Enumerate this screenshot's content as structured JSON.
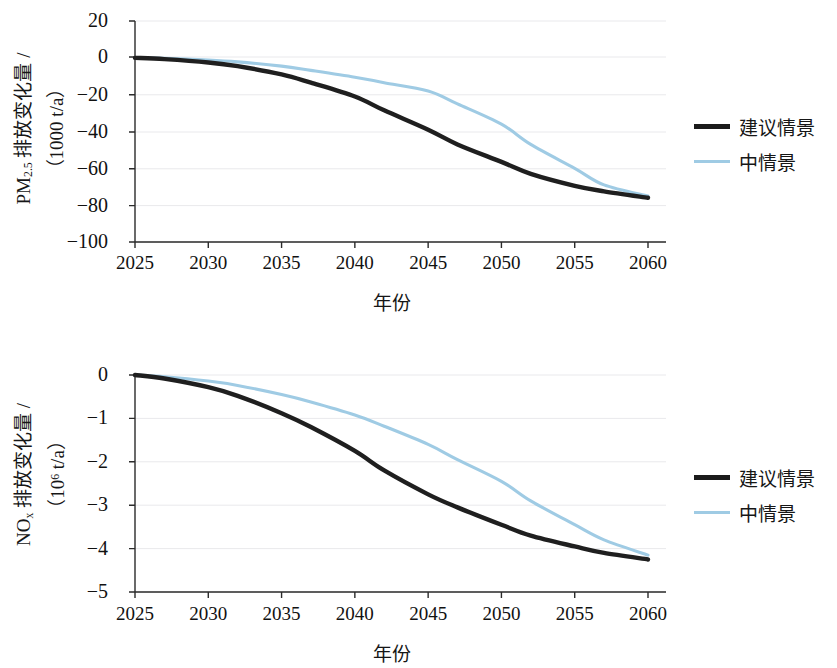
{
  "chart_data": [
    {
      "id": "pm25",
      "type": "line",
      "title": "",
      "xlabel": "年份",
      "ylabel": "PM2.5 排放变化量 / (1000 t/a)",
      "ylabel_parts": {
        "species": "PM",
        "species_sub": "2.5",
        "text": " 排放变化量 /",
        "unit": "（1000 t/a）"
      },
      "x": [
        2025,
        2030,
        2035,
        2040,
        2045,
        2050,
        2055,
        2060
      ],
      "xticks": [
        "2025",
        "2030",
        "2035",
        "2040",
        "2045",
        "2050",
        "2055",
        "2060"
      ],
      "yticks": [
        "20",
        "0",
        "−20",
        "−40",
        "−60",
        "−80",
        "−100"
      ],
      "ylim": [
        -100,
        20
      ],
      "xlim": [
        2025,
        2060
      ],
      "grid": true,
      "legend_position": "right",
      "series": [
        {
          "name": "建议情景",
          "color": "#1f1f1f",
          "x": [
            2025,
            2027,
            2030,
            2032,
            2035,
            2037,
            2040,
            2042,
            2045,
            2047,
            2050,
            2052,
            2055,
            2057,
            2060
          ],
          "values": [
            0,
            -0.7,
            -2.5,
            -4.5,
            -9.0,
            -13.5,
            -21.0,
            -28.5,
            -39.0,
            -47.0,
            -56.5,
            -63.0,
            -69.5,
            -72.5,
            -76.0
          ]
        },
        {
          "name": "中情景",
          "color": "#9fcbe4",
          "x": [
            2025,
            2027,
            2030,
            2032,
            2035,
            2037,
            2040,
            2042,
            2045,
            2047,
            2050,
            2052,
            2055,
            2057,
            2060
          ],
          "values": [
            0,
            -0.3,
            -1.2,
            -2.2,
            -4.5,
            -6.8,
            -10.5,
            -13.5,
            -18.0,
            -25.0,
            -36.0,
            -47.0,
            -60.0,
            -69.0,
            -75.0
          ]
        }
      ]
    },
    {
      "id": "nox",
      "type": "line",
      "title": "",
      "xlabel": "年份",
      "ylabel": "NOx 排放变化量 / (10^6 t/a)",
      "ylabel_parts": {
        "species": "NO",
        "species_sub": "x",
        "text": " 排放变化量 /",
        "unit": "（10⁶ t/a）"
      },
      "x": [
        2025,
        2030,
        2035,
        2040,
        2045,
        2050,
        2055,
        2060
      ],
      "xticks": [
        "2025",
        "2030",
        "2035",
        "2040",
        "2045",
        "2050",
        "2055",
        "2060"
      ],
      "yticks": [
        "0",
        "−1",
        "−2",
        "−3",
        "−4",
        "−5"
      ],
      "ylim": [
        -5,
        0
      ],
      "xlim": [
        2025,
        2060
      ],
      "grid": true,
      "legend_position": "right",
      "series": [
        {
          "name": "建议情景",
          "color": "#1f1f1f",
          "x": [
            2025,
            2027,
            2030,
            2032,
            2035,
            2037,
            2040,
            2042,
            2045,
            2047,
            2050,
            2052,
            2055,
            2057,
            2060
          ],
          "values": [
            0,
            -0.08,
            -0.28,
            -0.48,
            -0.88,
            -1.2,
            -1.75,
            -2.2,
            -2.75,
            -3.05,
            -3.45,
            -3.7,
            -3.95,
            -4.1,
            -4.25
          ]
        },
        {
          "name": "中情景",
          "color": "#9fcbe4",
          "x": [
            2025,
            2027,
            2030,
            2032,
            2035,
            2037,
            2040,
            2042,
            2045,
            2047,
            2050,
            2052,
            2055,
            2057,
            2060
          ],
          "values": [
            0,
            -0.04,
            -0.14,
            -0.24,
            -0.45,
            -0.62,
            -0.92,
            -1.18,
            -1.6,
            -1.95,
            -2.45,
            -2.9,
            -3.45,
            -3.8,
            -4.15
          ]
        }
      ]
    }
  ],
  "panels": {
    "pm25": {
      "ytitle_species": "PM",
      "ytitle_sub": "2.5",
      "ytitle_text": " 排放变化量 /",
      "ytitle_unit": "（1000 t/a）",
      "xtitle": "年份",
      "yticks": [
        "20",
        "0",
        "−20",
        "−40",
        "−60",
        "−80",
        "−100"
      ],
      "xticks": [
        "2025",
        "2030",
        "2035",
        "2040",
        "2045",
        "2050",
        "2055",
        "2060"
      ],
      "legend": [
        {
          "label": "建议情景",
          "style": "black"
        },
        {
          "label": "中情景",
          "style": "blue"
        }
      ]
    },
    "nox": {
      "ytitle_species": "NO",
      "ytitle_sub": "x",
      "ytitle_text": " 排放变化量 /",
      "ytitle_unit_pre": "（10",
      "ytitle_unit_sup": "6",
      "ytitle_unit_post": " t/a）",
      "xtitle": "年份",
      "yticks": [
        "0",
        "−1",
        "−2",
        "−3",
        "−4",
        "−5"
      ],
      "xticks": [
        "2025",
        "2030",
        "2035",
        "2040",
        "2045",
        "2050",
        "2055",
        "2060"
      ],
      "legend": [
        {
          "label": "建议情景",
          "style": "black"
        },
        {
          "label": "中情景",
          "style": "blue"
        }
      ]
    }
  },
  "colors": {
    "series_black": "#1f1f1f",
    "series_blue": "#9fcbe4",
    "axis": "#2b2b2b",
    "grid": "#e9e9ec",
    "text": "#161616",
    "background": "#ffffff"
  }
}
